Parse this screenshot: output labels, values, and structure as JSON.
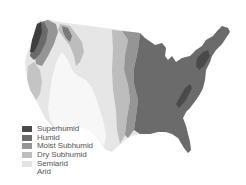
{
  "map": {
    "subject": "Contiguous United States moisture regions",
    "colors": {
      "superhumid": "#4a4a4a",
      "humid": "#6b6b6b",
      "moist_subhumid": "#959595",
      "dry_subhumid": "#bdbdbd",
      "semiarid": "#dcdcdc",
      "arid": "#f6f6f6"
    }
  },
  "legend": {
    "items": [
      {
        "label": "Superhumid",
        "color": "#4a4a4a"
      },
      {
        "label": "Humid",
        "color": "#6b6b6b"
      },
      {
        "label": "Moist Subhumid",
        "color": "#959595"
      },
      {
        "label": "Dry Subhumid",
        "color": "#bdbdbd"
      },
      {
        "label": "Semiarid",
        "color": "#e3e3e3"
      },
      {
        "label": "Arid",
        "color": "#ffffff"
      }
    ]
  }
}
